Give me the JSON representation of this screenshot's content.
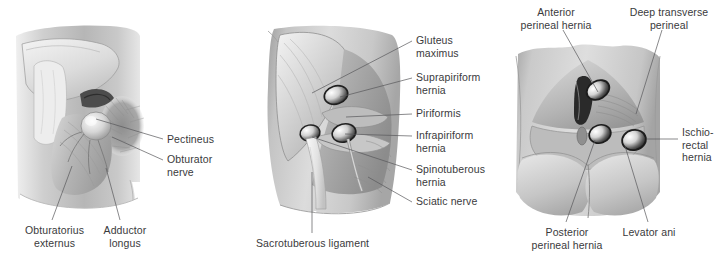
{
  "figure": {
    "background_color": "#ffffff",
    "label_color": "#3a3a3c",
    "leader_color": "#58585a",
    "width": 720,
    "height": 266
  },
  "panels": [
    {
      "id": "panel-left",
      "name": "anterior-thigh-obturator-region",
      "labels": [
        {
          "name": "label-pectineus",
          "text": "Pectineus"
        },
        {
          "name": "label-obturator-nerve",
          "text": "Obturator\nnerve"
        },
        {
          "name": "label-obturatorius-externus",
          "text": "Obturatorius\nexternus"
        },
        {
          "name": "label-adductor-longus",
          "text": "Adductor\nlongus"
        }
      ]
    },
    {
      "id": "panel-middle",
      "name": "gluteal-region-sciatic-hernias",
      "labels": [
        {
          "name": "label-gluteus-maximus",
          "text": "Gluteus\nmaximus"
        },
        {
          "name": "label-suprapiriform-hernia",
          "text": "Suprapiriform\nhernia"
        },
        {
          "name": "label-piriformis",
          "text": "Piriformis"
        },
        {
          "name": "label-infrapiriform-hernia",
          "text": "Infrapiriform\nhernia"
        },
        {
          "name": "label-spinotuberous-hernia",
          "text": "Spinotuberous\nhernia"
        },
        {
          "name": "label-sciatic-nerve",
          "text": "Sciatic nerve"
        },
        {
          "name": "label-sacrotuberous-ligament",
          "text": "Sacrotuberous ligament"
        }
      ]
    },
    {
      "id": "panel-right",
      "name": "perineal-region-hernias",
      "labels": [
        {
          "name": "label-anterior-perineal-hernia",
          "text": "Anterior\nperineal hernia"
        },
        {
          "name": "label-deep-transverse-perineal",
          "text": "Deep transverse\nperineal"
        },
        {
          "name": "label-ischiorectal-hernia",
          "text": "Ischio-\nrectal\nhernia"
        },
        {
          "name": "label-posterior-perineal-hernia",
          "text": "Posterior\nperineal hernia"
        },
        {
          "name": "label-levator-ani",
          "text": "Levator ani"
        }
      ]
    }
  ]
}
